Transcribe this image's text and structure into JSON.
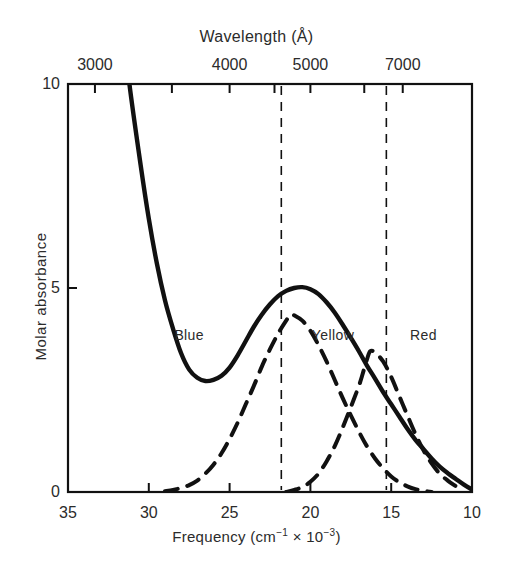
{
  "figure": {
    "background": "#ffffff",
    "ink_color": "#111111"
  },
  "chart_data": {
    "type": "line",
    "title": "",
    "xlabel": "Frequency (cm-1 x 10-3)",
    "xlabel_parts": {
      "lead": "Frequency (cm",
      "sup1": "−1",
      "mid": " × 10",
      "sup2": "−3",
      "tail": ")"
    },
    "ylabel": "Molar absorbance",
    "top_axis_label": "Wavelength (Å)",
    "xlim": [
      35,
      10
    ],
    "ylim": [
      0,
      10
    ],
    "x_ticks": [
      35,
      30,
      25,
      20,
      15,
      10
    ],
    "x_tick_labels": [
      "35",
      "30",
      "25",
      "20",
      "15",
      "10"
    ],
    "y_ticks": [
      0,
      5,
      10
    ],
    "y_tick_labels": [
      "0",
      "5",
      "10"
    ],
    "top_ticks_wavenumber": [
      33.333,
      28.571,
      25.0,
      22.222,
      20.0,
      16.667,
      14.286
    ],
    "top_tick_labels": [
      "3000",
      "",
      "4000",
      "",
      "5000",
      "7000",
      ""
    ],
    "top_labeled_ticks": [
      {
        "label": "3000",
        "wavelength_A": 3000,
        "wavenumber": 33.333
      },
      {
        "label": "4000",
        "wavelength_A": 4000,
        "wavenumber": 25.0
      },
      {
        "label": "5000",
        "wavelength_A": 5000,
        "wavenumber": 20.0
      },
      {
        "label": "7000",
        "wavelength_A": 7000,
        "wavenumber": 14.286
      }
    ],
    "grid": false,
    "legend_position": "none",
    "region_dividers_wavenumber": [
      21.8,
      15.3
    ],
    "regions": [
      {
        "label": "Blue",
        "center_wavenumber": 27.5,
        "y": 3.8
      },
      {
        "label": "Yellow",
        "center_wavenumber": 18.6,
        "y": 3.8
      },
      {
        "label": "Red",
        "center_wavenumber": 13.0,
        "y": 3.8
      }
    ],
    "series": [
      {
        "name": "total-absorbance",
        "style": "solid",
        "description": "Overall molar absorbance envelope: steep UV rise at high frequency, minimum near 26.5, broad visible band peaking at 5.0 near 20.5",
        "points": [
          [
            35,
            25.0
          ],
          [
            34,
            21.0
          ],
          [
            33,
            17.2
          ],
          [
            32.5,
            15.0
          ],
          [
            32,
            13.0
          ],
          [
            31.5,
            11.2
          ],
          [
            31.2,
            10.0
          ],
          [
            30.5,
            8.0
          ],
          [
            30,
            6.7
          ],
          [
            29.5,
            5.6
          ],
          [
            29,
            4.7
          ],
          [
            28.5,
            4.0
          ],
          [
            28,
            3.4
          ],
          [
            27.5,
            3.0
          ],
          [
            27,
            2.8
          ],
          [
            26.5,
            2.72
          ],
          [
            26,
            2.75
          ],
          [
            25.5,
            2.85
          ],
          [
            25,
            3.05
          ],
          [
            24.5,
            3.35
          ],
          [
            24,
            3.7
          ],
          [
            23.5,
            4.05
          ],
          [
            23,
            4.35
          ],
          [
            22.5,
            4.6
          ],
          [
            22,
            4.8
          ],
          [
            21.5,
            4.93
          ],
          [
            21,
            5.0
          ],
          [
            20.5,
            5.02
          ],
          [
            20,
            4.97
          ],
          [
            19.5,
            4.85
          ],
          [
            19,
            4.65
          ],
          [
            18.5,
            4.4
          ],
          [
            18,
            4.1
          ],
          [
            17.5,
            3.78
          ],
          [
            17,
            3.45
          ],
          [
            16.5,
            3.1
          ],
          [
            16,
            2.78
          ],
          [
            15.5,
            2.45
          ],
          [
            15,
            2.15
          ],
          [
            14.5,
            1.85
          ],
          [
            14,
            1.55
          ],
          [
            13.5,
            1.28
          ],
          [
            13,
            1.05
          ],
          [
            12.5,
            0.82
          ],
          [
            12,
            0.62
          ],
          [
            11.5,
            0.46
          ],
          [
            11,
            0.32
          ],
          [
            10.5,
            0.18
          ],
          [
            10,
            0.06
          ]
        ]
      },
      {
        "name": "component-band-1",
        "style": "dashed",
        "description": "Gaussian component centered near 21.2 with peak 4.35",
        "peak": {
          "x": 21.2,
          "y": 4.35
        },
        "points": [
          [
            29,
            0.02
          ],
          [
            28.5,
            0.05
          ],
          [
            28,
            0.1
          ],
          [
            27.5,
            0.17
          ],
          [
            27,
            0.28
          ],
          [
            26.5,
            0.45
          ],
          [
            26,
            0.67
          ],
          [
            25.5,
            0.95
          ],
          [
            25,
            1.3
          ],
          [
            24.5,
            1.7
          ],
          [
            24,
            2.15
          ],
          [
            23.5,
            2.6
          ],
          [
            23,
            3.08
          ],
          [
            22.5,
            3.5
          ],
          [
            22,
            3.88
          ],
          [
            21.5,
            4.2
          ],
          [
            21.2,
            4.35
          ],
          [
            21,
            4.33
          ],
          [
            20.5,
            4.2
          ],
          [
            20,
            3.95
          ],
          [
            19.5,
            3.6
          ],
          [
            19,
            3.2
          ],
          [
            18.5,
            2.75
          ],
          [
            18,
            2.3
          ],
          [
            17.5,
            1.88
          ],
          [
            17,
            1.48
          ],
          [
            16.5,
            1.12
          ],
          [
            16,
            0.82
          ],
          [
            15.5,
            0.58
          ],
          [
            15,
            0.38
          ],
          [
            14.5,
            0.24
          ],
          [
            14,
            0.14
          ],
          [
            13.5,
            0.07
          ],
          [
            13,
            0.03
          ],
          [
            12.5,
            0.0
          ]
        ]
      },
      {
        "name": "component-band-2",
        "style": "dashed",
        "description": "Gaussian component centered near 16.3 with peak 3.45",
        "peak": {
          "x": 16.3,
          "y": 3.45
        },
        "points": [
          [
            21.5,
            0.0
          ],
          [
            21,
            0.05
          ],
          [
            20.5,
            0.12
          ],
          [
            20,
            0.25
          ],
          [
            19.5,
            0.45
          ],
          [
            19,
            0.75
          ],
          [
            18.5,
            1.12
          ],
          [
            18,
            1.58
          ],
          [
            17.5,
            2.08
          ],
          [
            17,
            2.6
          ],
          [
            16.8,
            2.85
          ],
          [
            16.5,
            3.25
          ],
          [
            16.3,
            3.45
          ],
          [
            16,
            3.42
          ],
          [
            15.5,
            3.2
          ],
          [
            15,
            2.82
          ],
          [
            14.5,
            2.35
          ],
          [
            14,
            1.88
          ],
          [
            13.5,
            1.42
          ],
          [
            13,
            1.02
          ],
          [
            12.5,
            0.7
          ],
          [
            12,
            0.45
          ],
          [
            11.5,
            0.28
          ],
          [
            11,
            0.14
          ],
          [
            10.8,
            0.08
          ],
          [
            10.5,
            0.03
          ]
        ]
      }
    ]
  }
}
